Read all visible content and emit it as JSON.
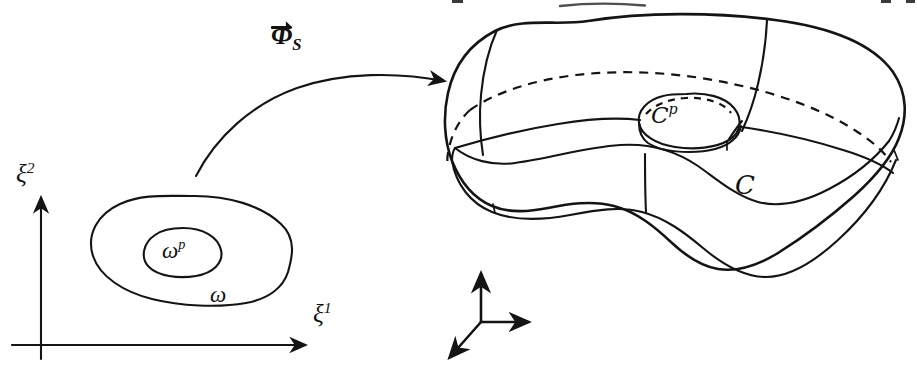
{
  "figure": {
    "kind": "mathematical-line-drawing",
    "caption_present": false,
    "background_color": "#ffffff",
    "ink_color": "#141414",
    "width": 917,
    "height": 373
  },
  "plane_domain": {
    "axis_x_label": "ξ",
    "axis_x_superscript": "1",
    "axis_y_label": "ξ",
    "axis_y_superscript": "2",
    "outer_region_label": "ω",
    "inner_region_label": "ω",
    "inner_region_superscript": "p"
  },
  "mapping": {
    "symbol": "Φ",
    "subscript": "S",
    "has_vector_arrow": true,
    "direction": "left-to-right"
  },
  "shell": {
    "surface_label": "𝒞",
    "surface_label_plain": "C",
    "patch_label": "𝒞",
    "patch_label_plain": "C",
    "patch_superscript": "p"
  },
  "triad": {
    "axes_count": 3,
    "labels": []
  }
}
